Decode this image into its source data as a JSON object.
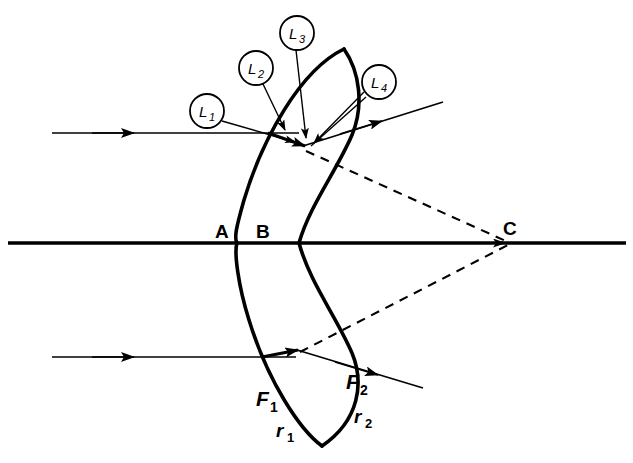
{
  "figure": {
    "background_color": "#ffffff",
    "stroke_color": "#000000",
    "width": 633,
    "height": 463
  },
  "axis": {
    "name": "optical-axis",
    "y": 243,
    "x_start": 8,
    "x_end": 625,
    "arrow_at_x": 512
  },
  "lens": {
    "name": "meniscus-lens",
    "surface_1_label": "A",
    "surface_2_label": "B",
    "vertex_a_x": 237,
    "vertex_b_x": 251
  },
  "labels": {
    "point_a": "A",
    "point_b": "B",
    "point_c": "C",
    "l1": "L",
    "l1_sub": "1",
    "l2": "L",
    "l2_sub": "2",
    "l3": "L",
    "l3_sub": "3",
    "l4": "L",
    "l4_sub": "4",
    "f1": "F",
    "f1_sub": "1",
    "f2": "F",
    "f2_sub": "2",
    "r1": "r",
    "r1_sub": "1",
    "r2": "r",
    "r2_sub": "2"
  },
  "rays": {
    "incident_upper": {
      "name": "incident-ray-upper",
      "y": 133,
      "x_start": 52,
      "x_end": 300,
      "arrow_x": 132
    },
    "incident_lower": {
      "name": "incident-ray-lower",
      "y": 357,
      "x_start": 52,
      "x_end": 296,
      "arrow_x": 132
    },
    "emergent_upper": {
      "name": "emergent-ray-upper",
      "from": [
        303,
        146
      ],
      "to": [
        441,
        103
      ],
      "arrow_at": [
        375,
        118
      ]
    },
    "emergent_lower": {
      "name": "emergent-ray-lower",
      "from": [
        296,
        350
      ],
      "to": [
        420,
        387
      ],
      "arrow_at": [
        372,
        373
      ]
    }
  },
  "construction": {
    "dashed_upper": {
      "name": "dashed-construction-upper",
      "from": [
        305,
        150
      ],
      "to": [
        509,
        242
      ]
    },
    "dashed_lower": {
      "name": "dashed-construction-lower",
      "from": [
        299,
        352
      ],
      "to": [
        509,
        244
      ]
    }
  },
  "callouts": [
    {
      "id": "l1",
      "cx": 207,
      "cy": 111,
      "r": 17,
      "tip": [
        292,
        140
      ]
    },
    {
      "id": "l2",
      "cx": 256,
      "cy": 68,
      "r": 17,
      "tip": [
        286,
        131
      ]
    },
    {
      "id": "l3",
      "cx": 297,
      "cy": 33,
      "r": 17,
      "tip": [
        305,
        139
      ]
    },
    {
      "id": "l4",
      "cx": 379,
      "cy": 82,
      "r": 17,
      "tip": [
        316,
        143
      ]
    }
  ]
}
